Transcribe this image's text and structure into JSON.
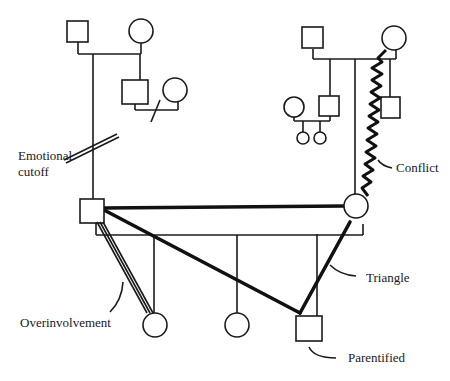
{
  "diagram": {
    "type": "genogram",
    "labels": {
      "emotional_cutoff_line1": "Emotional",
      "emotional_cutoff_line2": "cutoff",
      "conflict": "Conflict",
      "triangle": "Triangle",
      "overinvolvement": "Overinvolvement",
      "parentified": "Parentified"
    },
    "symbols": {
      "male": "square",
      "female": "circle"
    },
    "relationships": [
      {
        "type": "emotional-cutoff",
        "between": [
          "paternal-family",
          "father"
        ]
      },
      {
        "type": "conflict",
        "between": [
          "maternal-grandmother",
          "mother"
        ]
      },
      {
        "type": "triangle",
        "between": [
          "father",
          "mother",
          "parentified-son"
        ]
      },
      {
        "type": "overinvolvement",
        "between": [
          "father",
          "eldest-daughter"
        ]
      }
    ],
    "colors": {
      "ink": "#1a1a1a",
      "background": "#ffffff"
    }
  }
}
